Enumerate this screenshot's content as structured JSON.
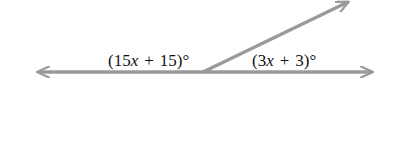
{
  "diagram": {
    "type": "linear-pair-angles",
    "line_color": "#9a9a9a",
    "vertex": [
      203,
      72
    ],
    "line": {
      "start": [
        38,
        72
      ],
      "end": [
        372,
        72
      ],
      "arrows": "both"
    },
    "ray": {
      "start": [
        203,
        72
      ],
      "end": [
        348,
        2
      ],
      "arrows": "end"
    },
    "angles": [
      {
        "name": "left-angle",
        "coef": "15",
        "var": "x",
        "op": "+",
        "const": "15",
        "deg": "°",
        "prefix": "(",
        "suffix": ")"
      },
      {
        "name": "right-angle",
        "coef": "3",
        "var": "x",
        "op": "+",
        "const": "3",
        "deg": "°",
        "prefix": "(",
        "suffix": ")"
      }
    ]
  }
}
